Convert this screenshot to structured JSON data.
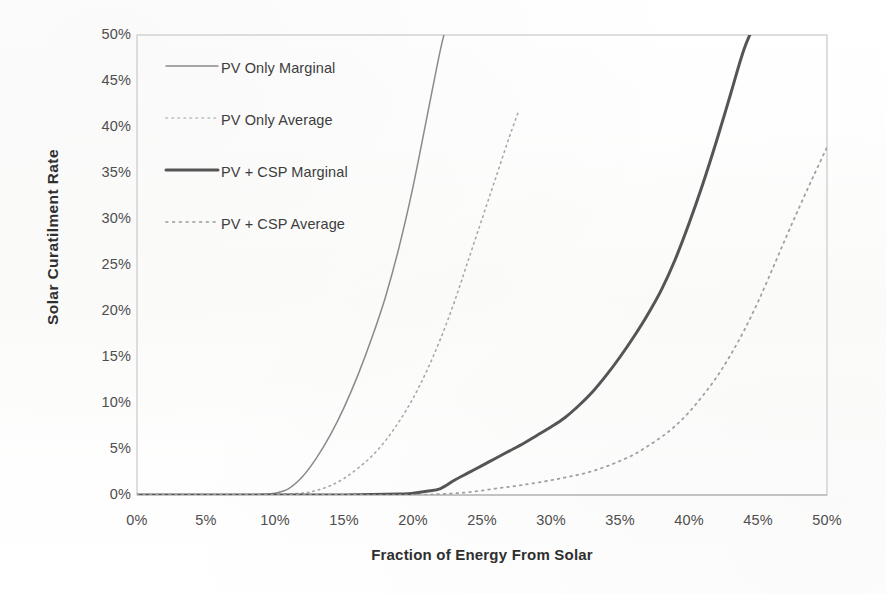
{
  "chart_data": {
    "type": "line",
    "title": "",
    "xlabel": "Fraction of Energy From Solar",
    "ylabel": "Solar Curatilment Rate",
    "xlim": [
      0,
      50
    ],
    "ylim": [
      0,
      50
    ],
    "grid": false,
    "legend_position": "upper-left-inside",
    "x_ticks": [
      "0%",
      "5%",
      "10%",
      "15%",
      "20%",
      "25%",
      "30%",
      "35%",
      "40%",
      "45%",
      "50%"
    ],
    "y_ticks": [
      "0%",
      "5%",
      "10%",
      "15%",
      "20%",
      "25%",
      "30%",
      "35%",
      "40%",
      "45%",
      "50%"
    ],
    "x_tick_values": [
      0,
      5,
      10,
      15,
      20,
      25,
      30,
      35,
      40,
      45,
      50
    ],
    "y_tick_values": [
      0,
      5,
      10,
      15,
      20,
      25,
      30,
      35,
      40,
      45,
      50
    ],
    "series": [
      {
        "name": "PV Only Marginal",
        "style": "solid",
        "width": 1.5,
        "color": "#8a8a8a",
        "x": [
          0,
          2,
          4,
          6,
          8,
          9,
          10,
          11,
          12,
          13,
          14,
          15,
          16,
          17,
          18,
          19,
          20,
          21,
          22,
          22.6
        ],
        "y": [
          0,
          0,
          0,
          0,
          0,
          0.05,
          0.2,
          0.7,
          2.0,
          4.0,
          6.5,
          9.5,
          13.0,
          17.0,
          21.5,
          27.0,
          33.5,
          41.0,
          48.5,
          52.0
        ]
      },
      {
        "name": "PV Only Average",
        "style": "dotted",
        "width": 1.6,
        "color": "#a8a8a8",
        "x": [
          0,
          4,
          8,
          10,
          12,
          13,
          14,
          15,
          16,
          17,
          18,
          19,
          20,
          21,
          22,
          23,
          24,
          25,
          26,
          27,
          27.6
        ],
        "y": [
          0,
          0,
          0,
          0.05,
          0.2,
          0.5,
          1.0,
          1.8,
          2.9,
          4.2,
          5.9,
          8.0,
          10.5,
          13.5,
          17.0,
          21.0,
          25.5,
          30.0,
          34.5,
          39.0,
          41.5
        ]
      },
      {
        "name": "PV + CSP Marginal",
        "style": "solid",
        "width": 3.0,
        "color": "#555555",
        "x": [
          0,
          5,
          10,
          15,
          19,
          20,
          21,
          22,
          23,
          24,
          25,
          26,
          27,
          28,
          29,
          30,
          31,
          32,
          33,
          34,
          35,
          36,
          37,
          38,
          39,
          40,
          41,
          42,
          43,
          44,
          45
        ],
        "y": [
          0,
          0,
          0,
          0,
          0.1,
          0.2,
          0.4,
          0.7,
          1.6,
          2.4,
          3.2,
          4.0,
          4.8,
          5.6,
          6.5,
          7.4,
          8.4,
          9.7,
          11.2,
          13.0,
          15.0,
          17.2,
          19.6,
          22.3,
          25.6,
          29.5,
          33.8,
          38.5,
          43.5,
          48.5,
          52.0
        ]
      },
      {
        "name": "PV + CSP  Average",
        "style": "dotted",
        "width": 1.8,
        "color": "#a0a0a0",
        "x": [
          0,
          5,
          10,
          15,
          20,
          22,
          24,
          26,
          28,
          30,
          31,
          32,
          33,
          34,
          35,
          36,
          37,
          38,
          39,
          40,
          41,
          42,
          43,
          44,
          45,
          46,
          47,
          48,
          49,
          50
        ],
        "y": [
          0,
          0,
          0,
          0,
          0,
          0.1,
          0.3,
          0.7,
          1.1,
          1.6,
          1.9,
          2.2,
          2.6,
          3.1,
          3.7,
          4.4,
          5.3,
          6.3,
          7.5,
          9.0,
          10.8,
          12.8,
          15.2,
          17.9,
          21.0,
          24.4,
          27.9,
          31.3,
          34.6,
          37.8
        ]
      }
    ]
  },
  "legend": {
    "items": [
      {
        "label": "PV Only Marginal",
        "style": "solid",
        "color": "#8a8a8a",
        "width": 1.5
      },
      {
        "label": "PV Only Average",
        "style": "dotted",
        "color": "#bcbcbc",
        "width": 1.6
      },
      {
        "label": "PV + CSP Marginal",
        "style": "solid",
        "color": "#555555",
        "width": 3.0
      },
      {
        "label": "PV + CSP  Average",
        "style": "dotted",
        "color": "#b0b0b0",
        "width": 1.8
      }
    ]
  },
  "colors": {
    "background": "#fdfdfc",
    "axis": "#b9b9b9",
    "tick_text": "#4e4e4e",
    "title_text": "#2f2f2f"
  }
}
